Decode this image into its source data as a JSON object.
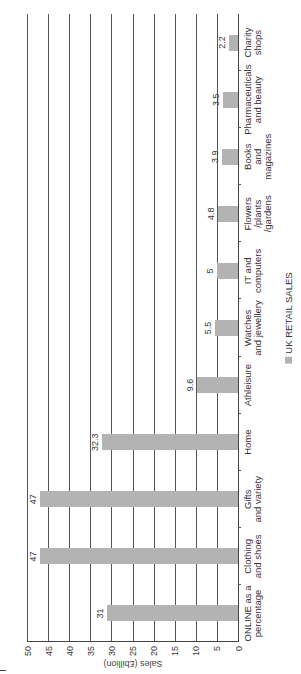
{
  "chart_data": {
    "type": "bar",
    "title": "",
    "orientation_note": "image rotated 90 degrees counter-clockwise",
    "xlabel": "",
    "ylabel": "Sales (£billion)",
    "ylim": [
      0,
      50
    ],
    "yticks": [
      0,
      5,
      10,
      15,
      20,
      25,
      30,
      35,
      40,
      45,
      50
    ],
    "grid": true,
    "legend": {
      "position": "bottom",
      "entries": [
        "UK RETAIL SALES"
      ]
    },
    "categories": [
      "ONLINE as a\npercentage",
      "Clothing\nand shoes",
      "Gifts\nand variety",
      "Home",
      "Athleisure",
      "Watches\nand jewellery",
      "IT and\ncomputers",
      "Flowers\n/plants\n/gardens",
      "Books\nand\nmagazines",
      "Pharmaceuticals\nand beauty",
      "Charity\nshops"
    ],
    "series": [
      {
        "name": "UK RETAIL SALES",
        "values": [
          31,
          47,
          47,
          32.3,
          9.6,
          5.5,
          5,
          4.8,
          3.9,
          3.5,
          2.2
        ],
        "labels": [
          "31",
          "47",
          "47",
          "32.3",
          "9.6",
          "5.5",
          "5",
          "4.8",
          "3.9",
          "3.5",
          "2.2"
        ]
      }
    ],
    "colors": {
      "bar": "#b3b3b3",
      "grid": "#555555",
      "text": "#333333"
    }
  },
  "ylabel": "Sales (£billion)",
  "legend_label": "UK RETAIL SALES"
}
